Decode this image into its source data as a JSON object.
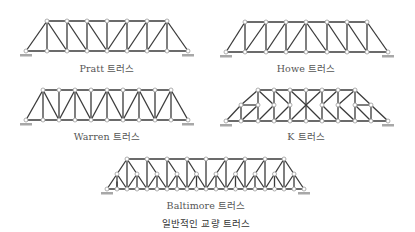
{
  "caption": "일반적인 교량 트러스",
  "colors": {
    "member": "#3a3a3a",
    "node_fill": "#ffffff",
    "node_stroke": "#9a9a9a",
    "support": "#a8a8a8",
    "label": "#555555"
  },
  "trusses": [
    {
      "id": "pratt",
      "label": "Pratt 트러스",
      "label_x": 107,
      "label_y": 61
    },
    {
      "id": "howe",
      "label": "Howe 트러스",
      "label_x": 306,
      "label_y": 61
    },
    {
      "id": "warren",
      "label": "Warren 트러스",
      "label_x": 107,
      "label_y": 129
    },
    {
      "id": "k",
      "label": "K 트러스",
      "label_x": 306,
      "label_y": 129
    },
    {
      "id": "baltimore",
      "label": "Baltimore 트러스",
      "label_x": 206,
      "label_y": 198
    }
  ]
}
